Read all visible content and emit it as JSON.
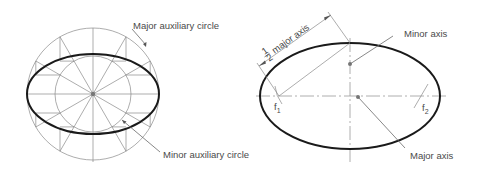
{
  "figure": {
    "left_diagram": {
      "title": "Auxiliary circle construction of ellipse",
      "labels": {
        "major_circle": "Major auxiliary circle",
        "minor_circle": "Minor auxiliary circle"
      },
      "geometry": {
        "cx": 93,
        "cy": 94,
        "major_r": 66,
        "minor_r": 38,
        "ellipse_rx": 66,
        "ellipse_ry": 40
      }
    },
    "right_diagram": {
      "title": "Ellipse foci construction",
      "labels": {
        "half_major_prefix_num": "1",
        "half_major_prefix_den": "2",
        "half_major": "major axis",
        "minor_axis": "Minor axis",
        "major_axis": "Major axis",
        "focus1": "f",
        "focus1_sub": "1",
        "focus2": "f",
        "focus2_sub": "2"
      },
      "geometry": {
        "cx": 350,
        "cy": 96,
        "rx": 90,
        "ry": 53,
        "f1x": 279,
        "f2x": 421
      }
    },
    "colors": {
      "outline": "#1a1a1a",
      "construction": "#8a8a8a",
      "text": "#4a4a4a"
    }
  }
}
